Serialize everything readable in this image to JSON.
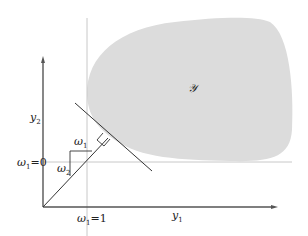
{
  "diagram": {
    "type": "production-possibility / efficiency diagram",
    "region_label": "𝒴",
    "region_fill": "#dcdcdc",
    "axes": {
      "x_label": "y",
      "x_label_sub": "1",
      "y_label": "y",
      "y_label_sub": "2",
      "axis_color": "#555555"
    },
    "reference_lines": {
      "vertical_label": "ω",
      "vertical_label_sub": "1",
      "vertical_label_value": "=1",
      "horizontal_label": "ω",
      "horizontal_label_sub": "1",
      "horizontal_label_value": "=0",
      "color": "#c8c8c8"
    },
    "slope_triangle": {
      "horizontal_label": "ω",
      "horizontal_label_sub": "1",
      "vertical_label": "ω",
      "vertical_label_sub": "2"
    },
    "line_color": "#333333"
  }
}
